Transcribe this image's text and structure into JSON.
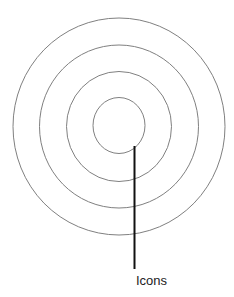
{
  "diagram": {
    "type": "concentric-circles",
    "center": [
      119,
      126.5
    ],
    "rings": [
      {
        "name": "outer",
        "rx": 106,
        "ry": 108.5
      },
      {
        "name": "second",
        "rx": 79.5,
        "ry": 81.5
      },
      {
        "name": "third",
        "rx": 52.5,
        "ry": 55
      },
      {
        "name": "inner",
        "rx": 26,
        "ry": 28
      }
    ],
    "ring_stroke": "#808080",
    "pointer": {
      "x": 134.5,
      "y1": 146,
      "y2": 269,
      "color": "#111111",
      "width": 2
    },
    "label": "Icons"
  }
}
